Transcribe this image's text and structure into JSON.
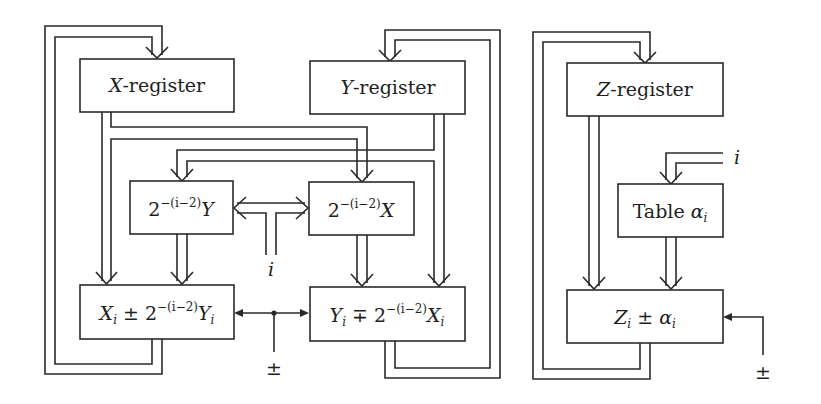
{
  "diagram": {
    "registers": {
      "x": {
        "var": "X",
        "suffix": "-register"
      },
      "y": {
        "var": "Y",
        "suffix": "-register"
      },
      "z": {
        "var": "Z",
        "suffix": "-register"
      }
    },
    "shifters": {
      "y_shift": {
        "base": "2",
        "exp": "−(i−2)",
        "var": "Y"
      },
      "x_shift": {
        "base": "2",
        "exp": "−(i−2)",
        "var": "X"
      }
    },
    "table": {
      "label": "Table ",
      "var": "α",
      "sub": "i"
    },
    "adders": {
      "x_adder": {
        "a": "X",
        "a_sub": "i",
        "op": " ± ",
        "base": "2",
        "exp": "−(i−2)",
        "b": "Y",
        "b_sub": "i"
      },
      "y_adder": {
        "a": "Y",
        "a_sub": "i",
        "op": " ∓ ",
        "base": "2",
        "exp": "−(i−2)",
        "b": "X",
        "b_sub": "i"
      },
      "z_adder": {
        "a": "Z",
        "a_sub": "i",
        "op": " ± ",
        "b": "α",
        "b_sub": "i"
      }
    },
    "inputs": {
      "shift_index": "i",
      "table_index": "i",
      "xy_sign": "±",
      "z_sign": "±"
    },
    "colors": {
      "line": "#2a2a2a",
      "text": "#1e1e1e",
      "background": "#ffffff"
    }
  }
}
